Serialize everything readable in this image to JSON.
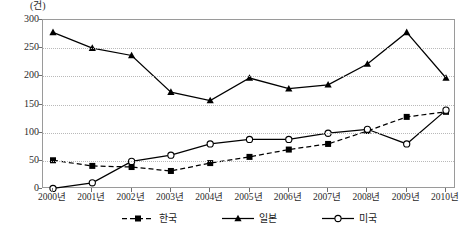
{
  "chart_data": {
    "type": "line",
    "title": "",
    "subtitle": "",
    "unit_label": "(건)",
    "xlabel": "",
    "ylabel": "",
    "categories": [
      "2000년",
      "2001년",
      "2002년",
      "2003년",
      "2004년",
      "2005년",
      "2006년",
      "2007년",
      "2008년",
      "2009년",
      "2010년"
    ],
    "ylim": [
      0,
      300
    ],
    "yticks": [
      0,
      50,
      100,
      150,
      200,
      250,
      300
    ],
    "ytick_labels": [
      "0",
      "50",
      "100",
      "150",
      "200",
      "250",
      "300"
    ],
    "grid": true,
    "grid_axis": "y",
    "legend_position": "bottom",
    "series": [
      {
        "name": "한국",
        "marker": "filled-square",
        "line_style": "dashed",
        "color": "#000000",
        "values": [
          51,
          41,
          39,
          32,
          46,
          57,
          70,
          80,
          103,
          128,
          137
        ]
      },
      {
        "name": "일본",
        "marker": "filled-triangle",
        "line_style": "solid",
        "color": "#000000",
        "values": [
          278,
          250,
          237,
          172,
          157,
          197,
          178,
          185,
          222,
          278,
          197
        ]
      },
      {
        "name": "미국",
        "marker": "open-circle",
        "line_style": "solid",
        "color": "#000000",
        "values": [
          1,
          11,
          49,
          60,
          80,
          88,
          88,
          99,
          106,
          80,
          140
        ]
      }
    ]
  },
  "legend": {
    "items": [
      {
        "label": "한국",
        "marker": "filled-square",
        "line_style": "dashed"
      },
      {
        "label": "일본",
        "marker": "filled-triangle",
        "line_style": "solid"
      },
      {
        "label": "미국",
        "marker": "open-circle",
        "line_style": "solid"
      }
    ]
  }
}
